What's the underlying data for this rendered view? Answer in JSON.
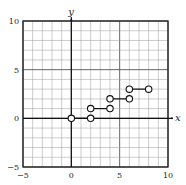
{
  "chart_data": {
    "type": "line",
    "title": "",
    "xlabel": "x",
    "ylabel": "y",
    "xlim": [
      -5,
      10
    ],
    "ylim": [
      -5,
      10
    ],
    "grid": true,
    "grid_step": 1,
    "x_ticks": [
      -5,
      0,
      5,
      10
    ],
    "y_ticks": [
      -5,
      0,
      5,
      10
    ],
    "x_tick_labels": [
      "−5",
      "0",
      "5",
      "10"
    ],
    "y_tick_labels": [
      "−5",
      "0",
      "5",
      "10"
    ],
    "legend": null,
    "series": [
      {
        "name": "step function",
        "style": "horizontal segments with open circles at both endpoints",
        "segments": [
          {
            "x0": 0,
            "x1": 2,
            "y": 0,
            "left_open": true,
            "right_open": true
          },
          {
            "x0": 2,
            "x1": 4,
            "y": 1,
            "left_open": true,
            "right_open": true
          },
          {
            "x0": 4,
            "x1": 6,
            "y": 2,
            "left_open": true,
            "right_open": true
          },
          {
            "x0": 6,
            "x1": 8,
            "y": 3,
            "left_open": true,
            "right_open": true
          }
        ]
      }
    ]
  },
  "colors": {
    "grid": "#9a9a9a",
    "frame": "#222222",
    "axis": "#111111",
    "series": "#111111",
    "background": "#ffffff"
  }
}
